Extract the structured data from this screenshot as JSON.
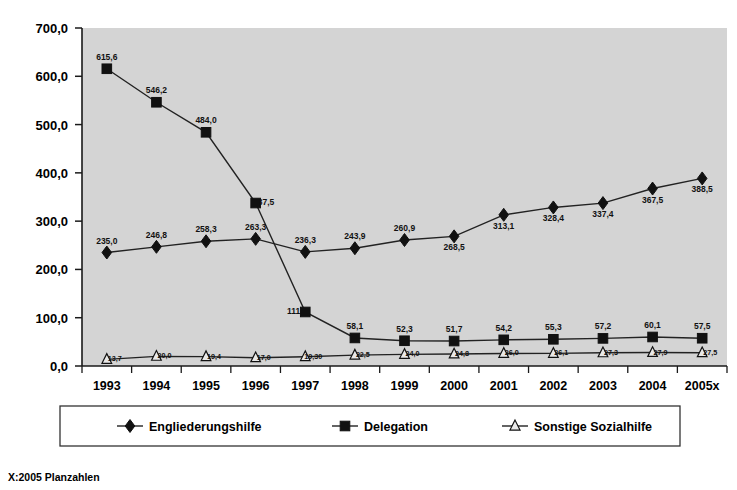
{
  "chart_data": {
    "type": "line",
    "title": "",
    "xlabel": "",
    "ylabel": "",
    "ylim": [
      0,
      700
    ],
    "ytick_labels": [
      "0,0",
      "100,0",
      "200,0",
      "300,0",
      "400,0",
      "500,0",
      "600,0",
      "700,0"
    ],
    "ytick_values": [
      0,
      100,
      200,
      300,
      400,
      500,
      600,
      700
    ],
    "grid": false,
    "legend_position": "bottom",
    "categories": [
      "1993",
      "1994",
      "1995",
      "1996",
      "1997",
      "1998",
      "1999",
      "2000",
      "2001",
      "2002",
      "2003",
      "2004",
      "2005x"
    ],
    "series": [
      {
        "name": "Engliederungshilfe",
        "marker": "diamond",
        "values": [
          235.0,
          246.8,
          258.3,
          263.3,
          236.3,
          243.9,
          260.9,
          268.5,
          313.1,
          328.4,
          337.4,
          367.5,
          388.5
        ],
        "labels": [
          "235,0",
          "246,8",
          "258,3",
          "263,3",
          "236,3",
          "243,9",
          "260,9",
          "268,5",
          "313,1",
          "328,4",
          "337,4",
          "367,5",
          "388,5"
        ],
        "label_positions": [
          "above",
          "above",
          "above",
          "above",
          "above",
          "above",
          "above",
          "below",
          "below",
          "below",
          "below",
          "below",
          "below"
        ]
      },
      {
        "name": "Delegation",
        "marker": "square",
        "values": [
          615.6,
          546.2,
          484.0,
          337.5,
          111.9,
          58.1,
          52.3,
          51.7,
          54.2,
          55.3,
          57.2,
          60.1,
          57.5
        ],
        "labels": [
          "615,6",
          "546,2",
          "484,0",
          "337,5",
          "111,9",
          "58,1",
          "52,3",
          "51,7",
          "54,2",
          "55,3",
          "57,2",
          "60,1",
          "57,5"
        ],
        "label_positions": [
          "above",
          "above",
          "above",
          "right",
          "left",
          "above",
          "above",
          "above",
          "above",
          "above",
          "above",
          "above",
          "above"
        ]
      },
      {
        "name": "Sonstige Sozialhilfe",
        "marker": "triangle",
        "values": [
          13.7,
          20.0,
          19.4,
          17.0,
          19.3,
          22.5,
          24.0,
          24.8,
          26.0,
          26.1,
          27.3,
          27.9,
          27.5
        ],
        "labels": [
          "13,7",
          "20,0",
          "19,4",
          "17,0",
          "19,30",
          "22,5",
          "24,0",
          "24,8",
          "26,0",
          "26,1",
          "27,3",
          "27,9",
          "27,5"
        ],
        "label_positions": [
          "right",
          "right",
          "right",
          "right",
          "right",
          "right",
          "right",
          "right",
          "right",
          "right",
          "right",
          "right",
          "right"
        ]
      }
    ]
  },
  "legend": {
    "items": [
      {
        "label": "Engliederungshilfe",
        "marker": "diamond"
      },
      {
        "label": "Delegation",
        "marker": "square"
      },
      {
        "label": "Sonstige Sozialhilfe",
        "marker": "triangle"
      }
    ]
  },
  "footnote": {
    "text": "X:2005 Planzahlen"
  },
  "colors": {
    "plot_background": "#d4d4d4",
    "page_background": "#ffffff",
    "line": "#222222",
    "marker_fill": "#111111",
    "marker_open_fill": "#e9e9e9",
    "text": "#000000"
  }
}
